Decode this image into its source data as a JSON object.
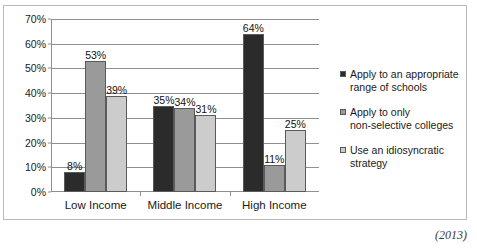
{
  "chart_data": {
    "type": "bar",
    "title": "",
    "subtitle": "",
    "xlabel": "",
    "ylabel": "",
    "ylim": [
      0,
      70
    ],
    "ytick_labels": [
      "0%",
      "10%",
      "20%",
      "30%",
      "40%",
      "50%",
      "60%",
      "70%"
    ],
    "ytick_values": [
      0,
      10,
      20,
      30,
      40,
      50,
      60,
      70
    ],
    "grid": true,
    "legend_position": "right",
    "categories": [
      "Low Income",
      "Middle Income",
      "High Income"
    ],
    "series": [
      {
        "name": "Apply to an appropriate\nrange of schools",
        "color": "#2b2b2b",
        "values": [
          8,
          35,
          64
        ],
        "value_labels": [
          "8%",
          "35%",
          "64%"
        ]
      },
      {
        "name": "Apply to only\nnon-selective colleges",
        "color": "#9a9a9a",
        "values": [
          53,
          34,
          11
        ],
        "value_labels": [
          "53%",
          "34%",
          "11%"
        ]
      },
      {
        "name": "Use an idiosyncratic\nstrategy",
        "color": "#cccccc",
        "values": [
          39,
          31,
          25
        ],
        "value_labels": [
          "39%",
          "31%",
          "25%"
        ]
      }
    ]
  },
  "footer": {
    "source_note": "(2013)"
  },
  "colors": {
    "axis": "#8f8f8f",
    "frame": "#b9b9b9",
    "bar_outline": "#5a5a5a",
    "text": "#1a1a1a"
  }
}
